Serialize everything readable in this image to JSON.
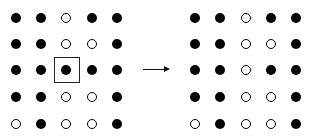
{
  "diagram": {
    "left_grid": {
      "rows": [
        [
          1,
          1,
          0,
          1,
          1
        ],
        [
          1,
          1,
          0,
          0,
          1
        ],
        [
          1,
          1,
          1,
          1,
          1
        ],
        [
          1,
          1,
          0,
          0,
          1
        ],
        [
          0,
          1,
          0,
          0,
          1
        ]
      ],
      "highlighted_cell": {
        "row": 2,
        "col": 2
      }
    },
    "right_grid": {
      "rows": [
        [
          1,
          1,
          0,
          1,
          1
        ],
        [
          1,
          1,
          0,
          0,
          1
        ],
        [
          1,
          1,
          0,
          1,
          1
        ],
        [
          1,
          1,
          0,
          0,
          1
        ],
        [
          0,
          1,
          0,
          0,
          1
        ]
      ]
    },
    "arrow": {
      "direction": "right"
    },
    "legend": {
      "filled": "filled-dot",
      "empty": "hollow-dot"
    }
  }
}
